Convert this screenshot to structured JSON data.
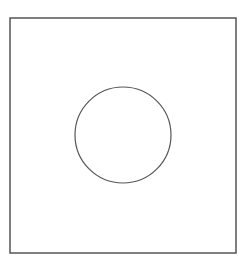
{
  "figure": {
    "background": "#ffffff",
    "square": {
      "x": 10,
      "y": 18,
      "width": 226,
      "height": 235,
      "stroke": "#555555",
      "stroke_width": 1.5
    },
    "circle": {
      "cx": 123,
      "cy": 135,
      "r": 48,
      "stroke": "#555555",
      "stroke_width": 1.2
    }
  }
}
